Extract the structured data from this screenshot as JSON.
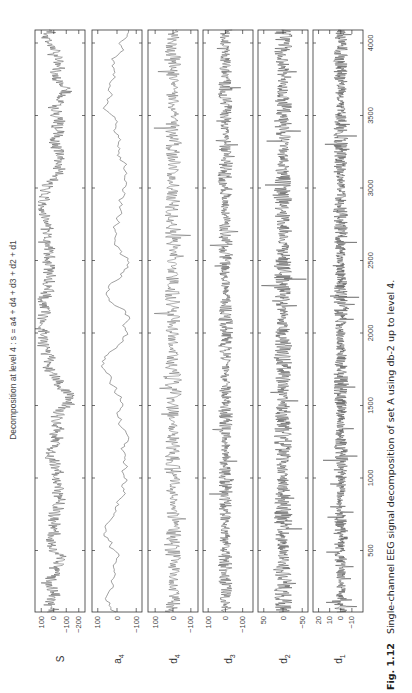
{
  "figure": {
    "title": "Decomposition at level 4 : s = a4 + d4 + d3 + d2 + d1",
    "caption_label": "Fig. 1.12",
    "caption_text": "Single-channel EEG signal decomposition of set A using db-2 up to level 4."
  },
  "chart_data": {
    "type": "line",
    "title": "Decomposition at level 4 : s = a4 + d4 + d3 + d2 + d1",
    "xlabel": "",
    "ylabel": "",
    "orientation": "rotated 90° counter-clockwise (sample axis runs bottom-to-top)",
    "x_ticks": [
      500,
      1000,
      1500,
      2000,
      2500,
      3000,
      3500,
      4000
    ],
    "xlim": [
      0,
      4097
    ],
    "grid": false,
    "legend": null,
    "panels": [
      {
        "name": "S",
        "label_main": "S",
        "label_sub": "",
        "yticks": [
          100,
          0,
          -100,
          -200
        ],
        "ylim": [
          150,
          -250
        ],
        "amplitude": 90,
        "style": "eeg",
        "color": "#555555"
      },
      {
        "name": "a4",
        "label_main": "a",
        "label_sub": "4",
        "yticks": [
          100,
          0,
          -100
        ],
        "ylim": [
          130,
          -130
        ],
        "amplitude": 85,
        "style": "smooth",
        "color": "#777777"
      },
      {
        "name": "d4",
        "label_main": "d",
        "label_sub": "4",
        "yticks": [
          100,
          0,
          -100
        ],
        "ylim": [
          140,
          -140
        ],
        "amplitude": 45,
        "style": "medium",
        "color": "#666666"
      },
      {
        "name": "d3",
        "label_main": "d",
        "label_sub": "3",
        "yticks": [
          100,
          0,
          -100
        ],
        "ylim": [
          130,
          -160
        ],
        "amplitude": 40,
        "style": "dense",
        "color": "#555555"
      },
      {
        "name": "d2",
        "label_main": "d",
        "label_sub": "2",
        "yticks": [
          50,
          0,
          -50
        ],
        "ylim": [
          65,
          -65
        ],
        "amplitude": 22,
        "style": "dense",
        "color": "#4a4a4a"
      },
      {
        "name": "d1",
        "label_main": "d",
        "label_sub": "1",
        "yticks": [
          20,
          10,
          0,
          -10
        ],
        "ylim": [
          25,
          -20
        ],
        "amplitude": 6,
        "style": "verydense",
        "color": "#4a4a4a"
      }
    ]
  },
  "layout": {
    "panel_x": [
      35,
      92,
      148,
      203,
      258,
      313
    ],
    "panel_width": 50,
    "plot_top": 30,
    "plot_bottom": 612,
    "px_per_500": 72.5,
    "sample_zero_y": 623
  }
}
